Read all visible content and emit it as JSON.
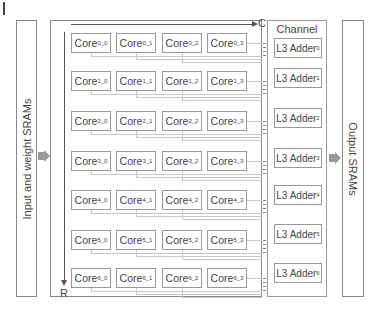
{
  "diagram": {
    "input_sram": {
      "label": "Input and weight SRAMs"
    },
    "output_sram": {
      "label": "Output SRAMs"
    },
    "axes": {
      "column_axis": "C",
      "row_axis": "R"
    },
    "channel_adders": {
      "title_line1": "Channel",
      "title_line2": "adders",
      "adders": [
        {
          "label": "L3 Adder",
          "sub": "0"
        },
        {
          "label": "L3 Adder",
          "sub": "1"
        },
        {
          "label": "L3 Adder",
          "sub": "2"
        },
        {
          "label": "L3 Adder",
          "sub": "3"
        },
        {
          "label": "L3 Adder",
          "sub": "4"
        },
        {
          "label": "L3 Adder",
          "sub": "5"
        },
        {
          "label": "L3 Adder",
          "sub": "6"
        }
      ]
    },
    "core_grid": {
      "rows": 7,
      "cols": 4,
      "core_label": "Core",
      "cores": [
        [
          "0_0",
          "0_1",
          "0_2",
          "0_3"
        ],
        [
          "1_0",
          "1_1",
          "1_2",
          "1_3"
        ],
        [
          "2_0",
          "2_1",
          "2_2",
          "2_3"
        ],
        [
          "3_0",
          "3_1",
          "3_2",
          "3_3"
        ],
        [
          "4_0",
          "4_1",
          "4_2",
          "4_3"
        ],
        [
          "5_0",
          "5_1",
          "5_2",
          "5_3"
        ],
        [
          "6_0",
          "6_1",
          "6_2",
          "6_3"
        ]
      ]
    }
  }
}
